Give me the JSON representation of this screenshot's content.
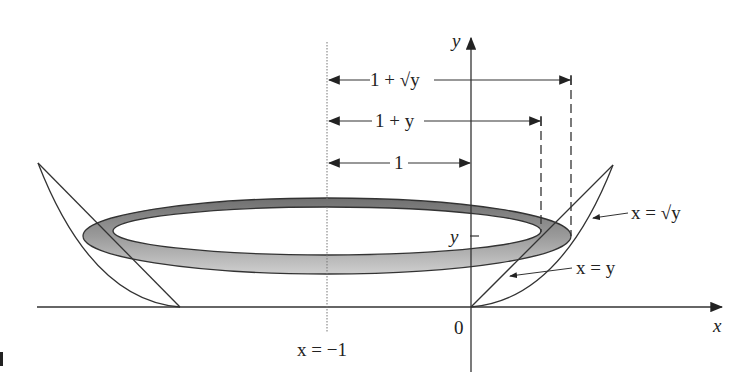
{
  "diagram": {
    "axes": {
      "x_label": "x",
      "y_label": "y",
      "origin_label": "0"
    },
    "reference_line": {
      "label": "x = −1",
      "x_value": -1
    },
    "curves": [
      {
        "name": "sqrt",
        "label": "x = √y"
      },
      {
        "name": "line",
        "label": "x = y"
      }
    ],
    "y_tick_label": "y",
    "dimensions": [
      {
        "label": "1 + √y",
        "meaning": "outer radius"
      },
      {
        "label": "1 + y",
        "meaning": "inner radius"
      },
      {
        "label": "1",
        "meaning": "distance from axis to y-axis"
      }
    ],
    "colors": {
      "line": "#333333",
      "ring_fill_dark": "#7a7a7a",
      "ring_fill_light": "#c4c4c4",
      "background": "#ffffff"
    }
  }
}
